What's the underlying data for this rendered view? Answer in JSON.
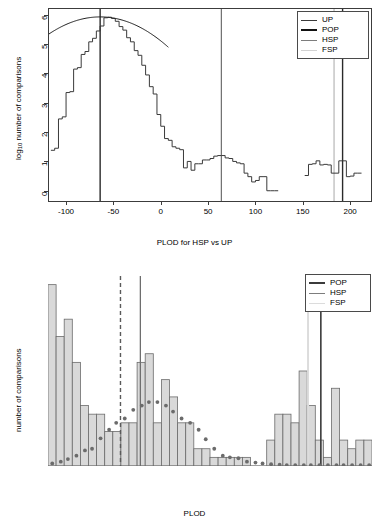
{
  "figure": {
    "panels": [
      "top-plot",
      "bottom-plot"
    ]
  },
  "top": {
    "xlabel": "PLOD for HSP vs UP",
    "ylabel_prefix": "log",
    "ylabel_sub": "10",
    "ylabel_suffix": " number of comparisons",
    "xticks": [
      "-100",
      "-50",
      "0",
      "50",
      "100",
      "150",
      "200"
    ],
    "yticks": [
      "0",
      "1",
      "2",
      "3",
      "4",
      "5",
      "6"
    ],
    "legend": {
      "items": [
        {
          "label": "UP",
          "color": "#3a3a3a",
          "width": 1.4
        },
        {
          "label": "POP",
          "color": "#111111",
          "width": 2.2
        },
        {
          "label": "HSP",
          "color": "#7d7d7d",
          "width": 1.4
        },
        {
          "label": "FSP",
          "color": "#d2d2d2",
          "width": 1.6
        }
      ]
    }
  },
  "bottom": {
    "xlabel": "PLOD",
    "ylabel": "number of comparisons",
    "xticks": [
      "0",
      "50",
      "100",
      "150",
      "200"
    ],
    "yticks": [
      "0",
      "5",
      "10",
      "15",
      "20"
    ],
    "legend": {
      "items": [
        {
          "label": "POP",
          "color": "#3b3b3b",
          "width": 2.2
        },
        {
          "label": "HSP",
          "color": "#7d7d7d",
          "width": 1.5
        },
        {
          "label": "FSP",
          "color": "#dcdcdc",
          "width": 1.8
        }
      ]
    }
  },
  "chart_data": [
    {
      "type": "line",
      "id": "top-plot",
      "title": "",
      "xlabel": "PLOD for HSP vs UP",
      "ylabel": "log10 number of comparisons",
      "xlim": [
        -118,
        222
      ],
      "ylim": [
        -0.35,
        6.2
      ],
      "xticks": [
        -100,
        -50,
        0,
        50,
        100,
        150,
        200
      ],
      "yticks": [
        0,
        1,
        2,
        3,
        4,
        5,
        6
      ],
      "grid": false,
      "legend_position": "top-right",
      "series": [
        {
          "name": "UP",
          "style": "step-histogram",
          "color": "#3a3a3a",
          "comment": "observed log10 counts of unrelated-pair PLOD scores, bin width 4",
          "x": [
            -116,
            -112,
            -108,
            -104,
            -100,
            -96,
            -92,
            -88,
            -84,
            -80,
            -76,
            -72,
            -68,
            -64,
            -60,
            -56,
            -52,
            -48,
            -44,
            -40,
            -36,
            -32,
            -28,
            -24,
            -20,
            -16,
            -12,
            -8,
            -4,
            0,
            4,
            8,
            12,
            16,
            20,
            24,
            28,
            32,
            36,
            40,
            44,
            48,
            52,
            56,
            60,
            64,
            68,
            72,
            76,
            80,
            84,
            88,
            92,
            96,
            100,
            104,
            108,
            112,
            116,
            120,
            124,
            128
          ],
          "y": [
            1.38,
            1.45,
            2.45,
            2.52,
            3.35,
            3.38,
            4.15,
            4.2,
            4.65,
            4.75,
            5.08,
            5.2,
            5.45,
            5.62,
            5.9,
            5.92,
            5.88,
            5.78,
            5.6,
            5.48,
            5.22,
            5.08,
            4.78,
            4.62,
            4.28,
            3.95,
            3.55,
            3.3,
            2.6,
            2.2,
            1.78,
            1.72,
            1.5,
            1.45,
            1.4,
            0.78,
            1.0,
            0.7,
            0.92,
            0.92,
            1.05,
            1.05,
            1.1,
            1.18,
            1.2,
            1.2,
            1.12,
            1.1,
            1.0,
            0.95,
            0.92,
            0.6,
            0.48,
            0.3,
            0.35,
            0.48,
            0.48,
            0.0,
            0.0,
            0.0,
            null,
            null
          ]
        },
        {
          "name": "HSP-observed",
          "style": "step-histogram",
          "color": "#3a3a3a",
          "comment": "right-hand cluster of half-sib / related pair scores",
          "x": [
            152,
            156,
            160,
            164,
            168,
            172,
            176,
            180,
            184,
            188,
            192,
            196,
            200,
            204,
            208
          ],
          "y": [
            0.52,
            0.9,
            0.92,
            1.02,
            0.88,
            0.9,
            0.88,
            0.6,
            0.6,
            1.02,
            1.02,
            0.48,
            0.5,
            0.6,
            0.6
          ]
        },
        {
          "name": "POP-fit",
          "style": "smooth-normal-curve",
          "color": "#1a1a1a",
          "comment": "fitted normal (log10 scale) to the unrelated-pair distribution",
          "mean": -64,
          "peak_log10": 5.93,
          "sd": 33,
          "x_range": [
            -118,
            8
          ]
        }
      ],
      "vlines": [
        {
          "name": "POP-left",
          "x": -64,
          "color": "#2a2a2a",
          "width": 1.4,
          "dash": "solid"
        },
        {
          "name": "HSP-mid",
          "x": 64,
          "color": "#6e6e6e",
          "width": 1.2,
          "dash": "solid"
        },
        {
          "name": "FSP",
          "x": 183,
          "color": "#cfcfcf",
          "width": 1.8,
          "dash": "solid"
        },
        {
          "name": "POP-right",
          "x": 192,
          "color": "#2a2a2a",
          "width": 1.4,
          "dash": "solid"
        }
      ]
    },
    {
      "type": "bar",
      "id": "bottom-plot",
      "title": "",
      "xlabel": "PLOD",
      "ylabel": "number of comparisons",
      "xlim": [
        0,
        228
      ],
      "ylim": [
        0,
        22
      ],
      "xticks": [
        0,
        50,
        100,
        150,
        200
      ],
      "yticks": [
        0,
        5,
        10,
        15,
        20
      ],
      "grid": false,
      "legend_position": "top-right",
      "bin_width": 5.7,
      "bar_fill": "#d9d9d9",
      "bar_stroke": "#6b6b6b",
      "bin_starts": [
        0,
        5.7,
        11.4,
        17.1,
        22.8,
        28.5,
        34.2,
        39.9,
        45.6,
        51.3,
        57,
        62.7,
        68.4,
        74.1,
        79.8,
        85.5,
        91.2,
        96.9,
        102.6,
        108.3,
        114,
        119.7,
        125.4,
        131.1,
        136.8,
        142.5,
        148.2,
        153.9,
        159.6,
        165.3,
        171,
        176.7,
        182.4,
        188.1,
        193.8,
        199.5,
        205.2,
        210.9,
        216.6,
        222.3
      ],
      "values": [
        21,
        15,
        17,
        12,
        7,
        6,
        6,
        4,
        4,
        5,
        5,
        12,
        13,
        5,
        10,
        8,
        5,
        5,
        2,
        2,
        1,
        1,
        1,
        1,
        1,
        0,
        0,
        3,
        6,
        6,
        5,
        11,
        7,
        3,
        1,
        9,
        3,
        2,
        3,
        3,
        1
      ],
      "overlay_points": {
        "name": "expected-HSP-density",
        "color": "#6b6b6b",
        "marker": "filled-circle",
        "x": [
          3,
          9,
          14,
          20,
          26,
          31,
          37,
          43,
          48,
          54,
          60,
          66,
          71,
          77,
          83,
          88,
          94,
          100,
          106,
          111,
          117,
          123,
          128,
          134,
          140,
          146,
          151,
          157,
          163,
          168,
          174,
          180,
          185,
          191,
          197,
          203,
          208,
          214,
          220,
          226
        ],
        "y": [
          0.3,
          0.5,
          0.8,
          1.2,
          1.8,
          2.0,
          3.2,
          4.2,
          5.0,
          5.5,
          6.5,
          7.0,
          7.4,
          7.4,
          7.0,
          6.3,
          5.5,
          5.0,
          4.2,
          3.1,
          2.0,
          1.2,
          1.0,
          0.9,
          0.5,
          0.4,
          0.3,
          0.2,
          0.15,
          0.1,
          0.1,
          0.1,
          0.1,
          0.1,
          0.1,
          0.1,
          0.1,
          0.1,
          0.1,
          0.1
        ]
      },
      "vlines": [
        {
          "name": "threshold-dashed",
          "x": 51,
          "color": "#5a5a5a",
          "width": 1.4,
          "dash": "dashed"
        },
        {
          "name": "HSP",
          "x": 65,
          "color": "#6e6e6e",
          "width": 1.3,
          "dash": "solid"
        },
        {
          "name": "FSP",
          "x": 183,
          "color": "#dcdcdc",
          "width": 2.0,
          "dash": "solid"
        },
        {
          "name": "POP",
          "x": 192,
          "color": "#3b3b3b",
          "width": 1.6,
          "dash": "solid"
        }
      ]
    }
  ]
}
